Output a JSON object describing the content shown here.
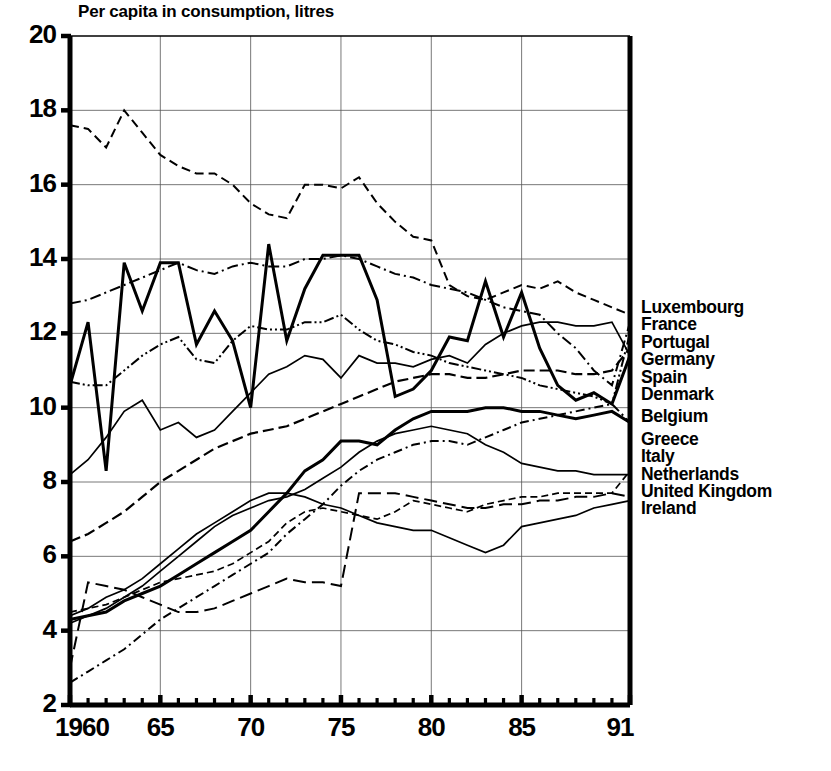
{
  "title": "Per capita in consumption, litres",
  "legend": {
    "entries": [
      {
        "label": "Luxembourg",
        "gap": false
      },
      {
        "label": "France",
        "gap": false
      },
      {
        "label": "Portugal",
        "gap": false
      },
      {
        "label": "Germany",
        "gap": false
      },
      {
        "label": "Spain",
        "gap": false
      },
      {
        "label": "Denmark",
        "gap": false
      },
      {
        "label": "Belgium",
        "gap": true
      },
      {
        "label": "Greece",
        "gap": true
      },
      {
        "label": "Italy",
        "gap": false
      },
      {
        "label": "Netherlands",
        "gap": false
      },
      {
        "label": "United Kingdom",
        "gap": false
      },
      {
        "label": "Ireland",
        "gap": false
      }
    ]
  },
  "axes": {
    "y_ticks": [
      "2",
      "4",
      "6",
      "8",
      "10",
      "12",
      "14",
      "16",
      "18",
      "20"
    ],
    "x_ticks": [
      "1960",
      "65",
      "70",
      "75",
      "80",
      "85",
      "91"
    ]
  },
  "chart_data": {
    "type": "line",
    "title": "Per capita in consumption, litres",
    "xlabel": "",
    "ylabel": "Per capita in consumption, litres",
    "xlim": [
      1960,
      1991
    ],
    "ylim": [
      2,
      20
    ],
    "y_ticks": [
      2,
      4,
      6,
      8,
      10,
      12,
      14,
      16,
      18,
      20
    ],
    "x_ticks": [
      1960,
      1965,
      1970,
      1975,
      1980,
      1985,
      1991
    ],
    "x_minor_tick_interval": 1,
    "grid": true,
    "legend_position": "right-inline-at-line-end",
    "x": [
      1960,
      1961,
      1962,
      1963,
      1964,
      1965,
      1966,
      1967,
      1968,
      1969,
      1970,
      1971,
      1972,
      1973,
      1974,
      1975,
      1976,
      1977,
      1978,
      1979,
      1980,
      1981,
      1982,
      1983,
      1984,
      1985,
      1986,
      1987,
      1988,
      1989,
      1990,
      1991
    ],
    "series": [
      {
        "name": "Luxembourg",
        "style": "solid-thick",
        "values": [
          10.6,
          12.3,
          8.3,
          13.9,
          12.6,
          13.9,
          13.9,
          11.7,
          12.6,
          11.8,
          10.0,
          14.4,
          11.8,
          13.2,
          14.1,
          14.1,
          14.1,
          12.9,
          10.3,
          10.5,
          11.0,
          11.9,
          11.8,
          13.4,
          11.9,
          13.1,
          11.6,
          10.6,
          10.2,
          10.4,
          10.1,
          11.4
        ]
      },
      {
        "name": "France",
        "style": "dashed",
        "values": [
          17.6,
          17.5,
          17.0,
          18.0,
          17.4,
          16.8,
          16.5,
          16.3,
          16.3,
          16.0,
          15.5,
          15.2,
          15.1,
          16.0,
          16.0,
          15.9,
          16.2,
          15.5,
          15.0,
          14.6,
          14.5,
          13.3,
          13.0,
          12.9,
          13.1,
          13.3,
          13.2,
          13.4,
          13.1,
          12.9,
          12.7,
          12.5
        ]
      },
      {
        "name": "Portugal",
        "style": "dash-dot",
        "values": [
          12.8,
          12.9,
          13.1,
          13.3,
          13.5,
          13.7,
          13.9,
          13.7,
          13.6,
          13.8,
          13.9,
          13.8,
          13.8,
          14.0,
          14.0,
          14.1,
          14.0,
          13.8,
          13.6,
          13.5,
          13.3,
          13.2,
          13.1,
          12.9,
          12.7,
          12.6,
          12.5,
          12.0,
          11.6,
          11.0,
          10.6,
          12.3
        ]
      },
      {
        "name": "Germany",
        "style": "dash-dot-dot",
        "values": [
          10.7,
          10.6,
          10.6,
          11.0,
          11.4,
          11.7,
          11.9,
          11.3,
          11.2,
          11.8,
          12.2,
          12.1,
          12.1,
          12.3,
          12.3,
          12.5,
          12.1,
          11.8,
          11.7,
          11.5,
          11.4,
          11.2,
          11.1,
          11.0,
          10.9,
          10.8,
          10.6,
          10.5,
          10.4,
          10.3,
          10.1,
          12.0
        ]
      },
      {
        "name": "Spain",
        "style": "dashed-medium",
        "values": [
          6.4,
          6.6,
          6.9,
          7.2,
          7.6,
          8.0,
          8.3,
          8.6,
          8.9,
          9.1,
          9.3,
          9.4,
          9.5,
          9.7,
          9.9,
          10.1,
          10.3,
          10.5,
          10.7,
          10.8,
          10.9,
          10.9,
          10.8,
          10.8,
          10.9,
          11.0,
          11.0,
          11.0,
          10.9,
          10.9,
          11.0,
          11.6
        ]
      },
      {
        "name": "Denmark",
        "style": "solid-thin",
        "values": [
          8.2,
          8.6,
          9.2,
          9.9,
          10.2,
          9.4,
          9.6,
          9.2,
          9.4,
          9.9,
          10.4,
          10.9,
          11.1,
          11.4,
          11.3,
          10.8,
          11.4,
          11.2,
          11.2,
          11.1,
          11.3,
          11.4,
          11.2,
          11.7,
          12.0,
          12.2,
          12.3,
          12.3,
          12.2,
          12.2,
          12.3,
          11.4
        ]
      },
      {
        "name": "Belgium",
        "style": "solid-thick-rising",
        "values": [
          4.3,
          4.4,
          4.5,
          4.8,
          5.0,
          5.2,
          5.5,
          5.8,
          6.1,
          6.4,
          6.7,
          7.2,
          7.7,
          8.3,
          8.6,
          9.1,
          9.1,
          9.0,
          9.4,
          9.7,
          9.9,
          9.9,
          9.9,
          10.0,
          10.0,
          9.9,
          9.9,
          9.8,
          9.7,
          9.8,
          9.9,
          9.6
        ]
      },
      {
        "name": "Greece",
        "style": "solid-thin-2",
        "values": [
          4.2,
          4.4,
          4.6,
          4.9,
          5.2,
          5.6,
          6.0,
          6.4,
          6.8,
          7.1,
          7.3,
          7.5,
          7.6,
          7.8,
          8.1,
          8.4,
          8.8,
          9.1,
          9.3,
          9.4,
          9.5,
          9.4,
          9.3,
          9.0,
          8.8,
          8.5,
          8.4,
          8.3,
          8.3,
          8.2,
          8.2,
          8.2
        ]
      },
      {
        "name": "Italy",
        "style": "dashed-long",
        "values": [
          3.0,
          5.3,
          5.2,
          5.1,
          4.9,
          4.7,
          4.5,
          4.5,
          4.6,
          4.8,
          5.0,
          5.2,
          5.4,
          5.3,
          5.3,
          5.2,
          7.7,
          7.7,
          7.7,
          7.6,
          7.5,
          7.4,
          7.3,
          7.3,
          7.4,
          7.4,
          7.5,
          7.5,
          7.6,
          7.6,
          7.7,
          7.6
        ]
      },
      {
        "name": "Netherlands",
        "style": "dash-dot-rising",
        "values": [
          2.6,
          2.9,
          3.2,
          3.5,
          3.9,
          4.3,
          4.6,
          4.9,
          5.2,
          5.5,
          5.8,
          6.1,
          6.6,
          7.0,
          7.4,
          7.9,
          8.3,
          8.6,
          8.8,
          9.0,
          9.1,
          9.1,
          9.0,
          9.2,
          9.4,
          9.6,
          9.7,
          9.8,
          9.9,
          10.0,
          10.1,
          9.6
        ]
      },
      {
        "name": "United Kingdom",
        "style": "dashed-fine",
        "values": [
          4.5,
          4.6,
          4.7,
          4.9,
          5.1,
          5.3,
          5.4,
          5.5,
          5.6,
          5.8,
          6.1,
          6.4,
          6.9,
          7.2,
          7.3,
          7.2,
          7.1,
          7.0,
          7.2,
          7.5,
          7.4,
          7.3,
          7.2,
          7.4,
          7.5,
          7.6,
          7.6,
          7.7,
          7.7,
          7.7,
          7.7,
          8.3
        ]
      },
      {
        "name": "Ireland",
        "style": "solid-thin-3",
        "values": [
          4.4,
          4.6,
          4.9,
          5.1,
          5.4,
          5.8,
          6.2,
          6.6,
          6.9,
          7.2,
          7.5,
          7.7,
          7.7,
          7.6,
          7.4,
          7.3,
          7.1,
          6.9,
          6.8,
          6.7,
          6.7,
          6.5,
          6.3,
          6.1,
          6.3,
          6.8,
          6.9,
          7.0,
          7.1,
          7.3,
          7.4,
          7.5
        ]
      }
    ]
  }
}
